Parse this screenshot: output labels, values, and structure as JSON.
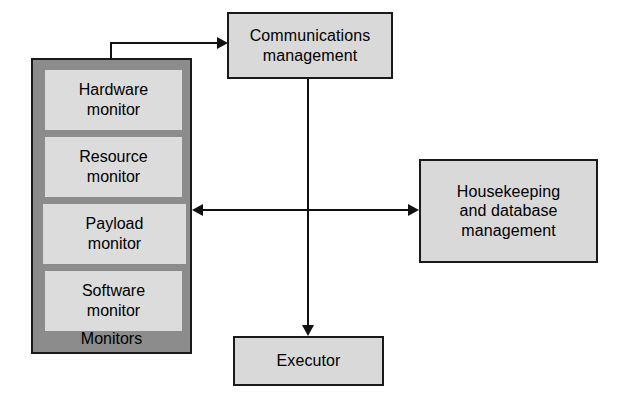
{
  "diagram": {
    "background_color": "#ffffff",
    "box_fill": "#d9d9d9",
    "monitor_fill": "#dcdcdc",
    "monitor_group_fill": "#8c8c8c",
    "border_color": "#1a1a1a",
    "line_color": "#111111"
  },
  "nodes": {
    "communications": {
      "label": "Communications\nmanagement",
      "x": 227,
      "y": 12,
      "w": 166,
      "h": 67
    },
    "housekeeping": {
      "label": "Housekeeping\nand database\nmanagement",
      "x": 419,
      "y": 159,
      "w": 179,
      "h": 104
    },
    "executor": {
      "label": "Executor",
      "x": 233,
      "y": 336,
      "w": 151,
      "h": 50
    }
  },
  "monitors_group": {
    "group_label": "Monitors",
    "x": 31,
    "y": 58,
    "w": 161,
    "h": 296,
    "items": [
      {
        "label": "Hardware\nmonitor",
        "x": 12,
        "y": 10,
        "w": 137,
        "h": 60
      },
      {
        "label": "Resource\nmonitor",
        "x": 12,
        "y": 77,
        "w": 137,
        "h": 60
      },
      {
        "label": "Payload\nmonitor",
        "x": 10,
        "y": 144,
        "w": 143,
        "h": 60
      },
      {
        "label": "Software\nmonitor",
        "x": 12,
        "y": 211,
        "w": 137,
        "h": 60
      }
    ]
  },
  "connectors": [
    {
      "name": "monitors-to-communications",
      "from": "monitors-group",
      "to": "communications",
      "style": "elbow",
      "arrowheads": "end"
    },
    {
      "name": "communications-to-executor",
      "from": "communications",
      "to": "executor",
      "style": "vertical",
      "arrowheads": "end"
    },
    {
      "name": "monitors-housekeeping-bidirectional",
      "from": "monitors-group",
      "to": "housekeeping",
      "style": "horizontal",
      "arrowheads": "both"
    }
  ]
}
